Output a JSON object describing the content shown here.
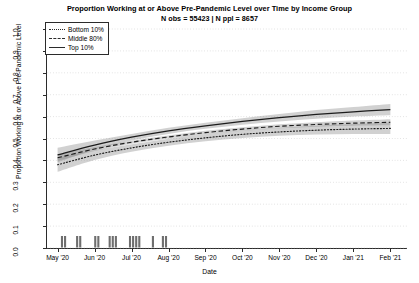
{
  "title": {
    "main": "Proportion Working at or Above Pre-Pandemic Level over Time by Income Group",
    "sub": "N obs = 55423 | N ppl = 8657"
  },
  "legend": {
    "items": [
      {
        "label": "Bottom 10%",
        "style": "dotted"
      },
      {
        "label": "Middle 80%",
        "style": "dashed"
      },
      {
        "label": "Top 10%",
        "style": "solid"
      }
    ]
  },
  "chart_data": {
    "type": "line",
    "title": "Proportion Working at or Above Pre-Pandemic Level over Time by Income Group",
    "subtitle": "N obs = 55423 | N ppl = 8657",
    "xlabel": "Date",
    "ylabel": "Proportion Working at or Above Pre-Pandemic Level",
    "ylim": [
      0.0,
      1.0
    ],
    "yticks": [
      "0.0",
      "0.1",
      "0.2",
      "0.3",
      "0.4",
      "0.5",
      "0.6",
      "0.7",
      "0.8",
      "0.9",
      "1.0"
    ],
    "ytick_values": [
      0.0,
      0.1,
      0.2,
      0.3,
      0.4,
      0.5,
      0.6,
      0.7,
      0.8,
      0.9,
      1.0
    ],
    "xticks": [
      "May '20",
      "Jun '20",
      "Jul '20",
      "Aug '20",
      "Sep '20",
      "Oct '20",
      "Nov '20",
      "Dec '20",
      "Jan '21",
      "Feb '21"
    ],
    "grid": true,
    "legend_position": "top-left",
    "x": [
      0,
      1,
      2,
      3,
      4,
      5,
      6,
      7,
      8,
      9
    ],
    "series": [
      {
        "name": "Top 10%",
        "style": "solid",
        "values": [
          0.425,
          0.47,
          0.506,
          0.535,
          0.558,
          0.578,
          0.595,
          0.61,
          0.622,
          0.632
        ],
        "ci_lower": [
          0.392,
          0.449,
          0.491,
          0.521,
          0.544,
          0.563,
          0.578,
          0.59,
          0.6,
          0.606
        ],
        "ci_upper": [
          0.458,
          0.491,
          0.521,
          0.549,
          0.572,
          0.593,
          0.612,
          0.63,
          0.644,
          0.658
        ]
      },
      {
        "name": "Middle 80%",
        "style": "dashed",
        "values": [
          0.412,
          0.452,
          0.483,
          0.507,
          0.527,
          0.543,
          0.556,
          0.564,
          0.57,
          0.574
        ],
        "ci_lower": [
          0.398,
          0.443,
          0.476,
          0.5,
          0.519,
          0.535,
          0.547,
          0.554,
          0.558,
          0.56
        ],
        "ci_upper": [
          0.426,
          0.461,
          0.49,
          0.514,
          0.535,
          0.551,
          0.565,
          0.574,
          0.582,
          0.588
        ]
      },
      {
        "name": "Bottom 10%",
        "style": "dotted",
        "values": [
          0.38,
          0.424,
          0.457,
          0.483,
          0.503,
          0.519,
          0.53,
          0.538,
          0.543,
          0.546
        ],
        "ci_lower": [
          0.348,
          0.402,
          0.44,
          0.467,
          0.487,
          0.502,
          0.512,
          0.518,
          0.52,
          0.52
        ],
        "ci_upper": [
          0.412,
          0.446,
          0.474,
          0.499,
          0.519,
          0.536,
          0.548,
          0.558,
          0.566,
          0.572
        ]
      }
    ],
    "rug": {
      "description": "observation-density rug marks along the x-axis baseline",
      "clusters": [
        {
          "start": 0.09,
          "end": 0.24
        },
        {
          "start": 0.5,
          "end": 0.65
        },
        {
          "start": 0.99,
          "end": 1.12
        },
        {
          "start": 1.38,
          "end": 1.55
        },
        {
          "start": 1.93,
          "end": 2.24
        },
        {
          "start": 2.55,
          "end": 2.62
        },
        {
          "start": 2.82,
          "end": 2.96
        }
      ]
    }
  },
  "axes": {
    "xlabel": "Date",
    "ylabel": "Proportion Working at or Above Pre-Pandemic Level"
  }
}
